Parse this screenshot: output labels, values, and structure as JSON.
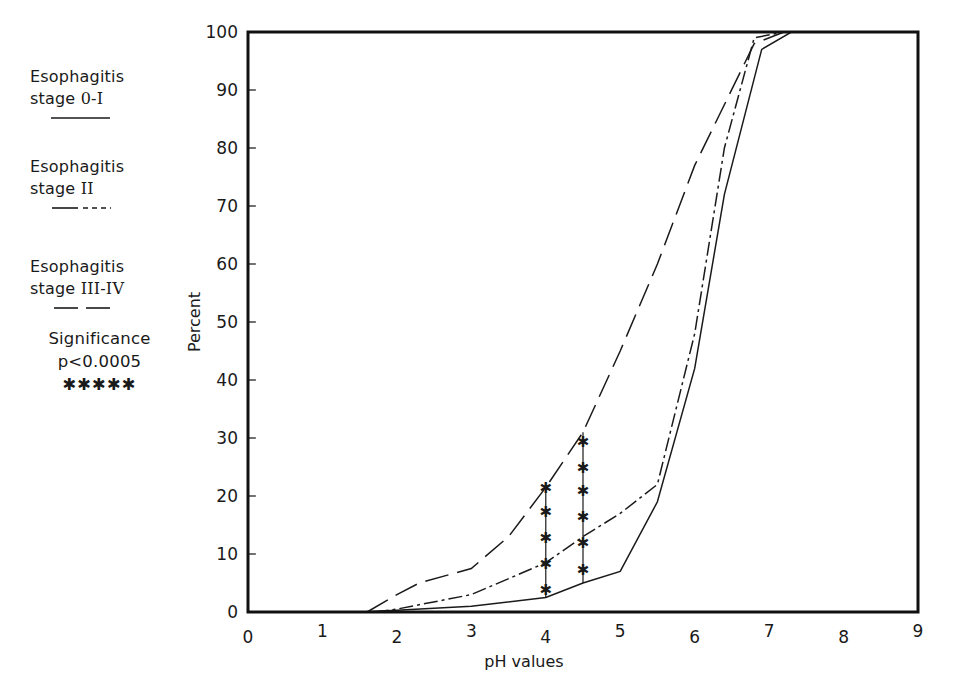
{
  "legend": {
    "entries": [
      {
        "line1": "Esophagitis",
        "line2_prefix": "stage ",
        "stage": "0-I",
        "style": "solid"
      },
      {
        "line1": "Esophagitis",
        "line2_prefix": "stage ",
        "stage": "II",
        "style": "dash-dot"
      },
      {
        "line1": "Esophagitis",
        "line2_prefix": "stage ",
        "stage": "III-IV",
        "style": "long-dash"
      }
    ],
    "significance": {
      "line1": "Significance",
      "line2": "p<0.0005",
      "marker": "✱✱✱✱✱"
    }
  },
  "chart_data": {
    "type": "line",
    "title": "",
    "xlabel": "pH values",
    "ylabel": "Percent",
    "xlim": [
      0,
      9
    ],
    "ylim": [
      0,
      100
    ],
    "x_ticks": [
      "0",
      "1",
      "2",
      "3",
      "4",
      "5",
      "6",
      "7",
      "8",
      "9"
    ],
    "y_ticks": [
      "0",
      "10",
      "20",
      "30",
      "40",
      "50",
      "60",
      "70",
      "80",
      "90",
      "100"
    ],
    "grid": false,
    "legend_position": "left-outside",
    "series": [
      {
        "name": "Esophagitis stage 0-I",
        "style": "solid",
        "points": [
          [
            0,
            0
          ],
          [
            1.5,
            0
          ],
          [
            2,
            0.3
          ],
          [
            3,
            1
          ],
          [
            4,
            2.5
          ],
          [
            4.5,
            5
          ],
          [
            5,
            7
          ],
          [
            5.5,
            19
          ],
          [
            6,
            42
          ],
          [
            6.4,
            72
          ],
          [
            6.9,
            97
          ],
          [
            7.3,
            100
          ],
          [
            9,
            100
          ]
        ]
      },
      {
        "name": "Esophagitis stage II",
        "style": "dash-dot",
        "points": [
          [
            1.7,
            0
          ],
          [
            2,
            0.5
          ],
          [
            3,
            3
          ],
          [
            4,
            8.5
          ],
          [
            4.5,
            13
          ],
          [
            5,
            17
          ],
          [
            5.5,
            22
          ],
          [
            6,
            48
          ],
          [
            6.4,
            80
          ],
          [
            6.8,
            99
          ],
          [
            7.2,
            100
          ]
        ]
      },
      {
        "name": "Esophagitis stage III-IV",
        "style": "long-dash",
        "points": [
          [
            1.6,
            0
          ],
          [
            2,
            3
          ],
          [
            2.3,
            5
          ],
          [
            3,
            7.5
          ],
          [
            3.5,
            13
          ],
          [
            4,
            21.5
          ],
          [
            4.5,
            31
          ],
          [
            5,
            45
          ],
          [
            5.5,
            60
          ],
          [
            6,
            77
          ],
          [
            6.8,
            98
          ],
          [
            7.2,
            100
          ]
        ]
      }
    ],
    "annotations": [
      {
        "type": "significance-bar",
        "x": 4.0,
        "y_from": 2.5,
        "y_to": 21.5,
        "markers": [
          4,
          8.5,
          13,
          17.5,
          21.5
        ],
        "label": "p<0.0005"
      },
      {
        "type": "significance-bar",
        "x": 4.5,
        "y_from": 5,
        "y_to": 31,
        "markers": [
          7.5,
          12,
          16.5,
          21,
          25,
          29.5
        ],
        "label": "p<0.0005"
      }
    ]
  }
}
